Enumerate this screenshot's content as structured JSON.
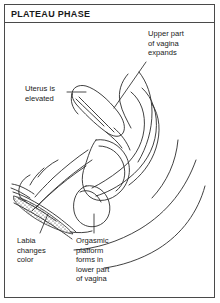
{
  "figure": {
    "title": "PLATEAU PHASE",
    "line_color": "#2b2b2b",
    "frame_color": "#4a4a4a",
    "background_color": "#ffffff",
    "text_color": "#1a1a1a"
  },
  "labels": {
    "upper_vagina": "Upper part\nof vagina\nexpands",
    "uterus": "Uterus is\nelevated",
    "labia": "Labia\nchanges\ncolor",
    "orgasmic_platform": "Orgasmic\nplatform\nforms in\nlower part\nof vagina"
  }
}
